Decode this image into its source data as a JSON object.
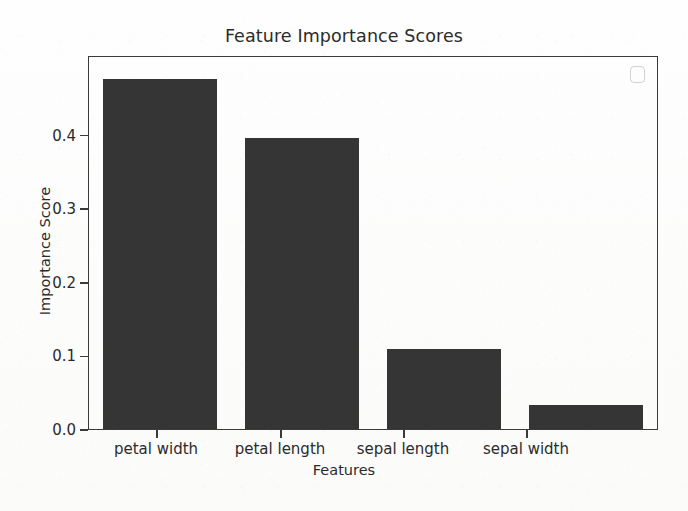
{
  "chart_data": {
    "type": "bar",
    "title": "Feature Importance Scores",
    "xlabel": "Features",
    "ylabel": "Importance Score",
    "categories": [
      "petal width",
      "petal length",
      "sepal length",
      "sepal width"
    ],
    "values": [
      0.478,
      0.397,
      0.109,
      0.033
    ],
    "ylim": [
      0.0,
      0.508
    ],
    "yticks": [
      "0.0",
      "0.1",
      "0.2",
      "0.3",
      "0.4"
    ],
    "ytick_values": [
      0.0,
      0.1,
      0.2,
      0.3,
      0.4
    ],
    "grid": false,
    "legend": "none",
    "bar_color": "#353535",
    "axes_color": "#3a3a3a",
    "background_color": "#fdfdfc"
  },
  "artifacts": {
    "legend_box_label": ""
  }
}
